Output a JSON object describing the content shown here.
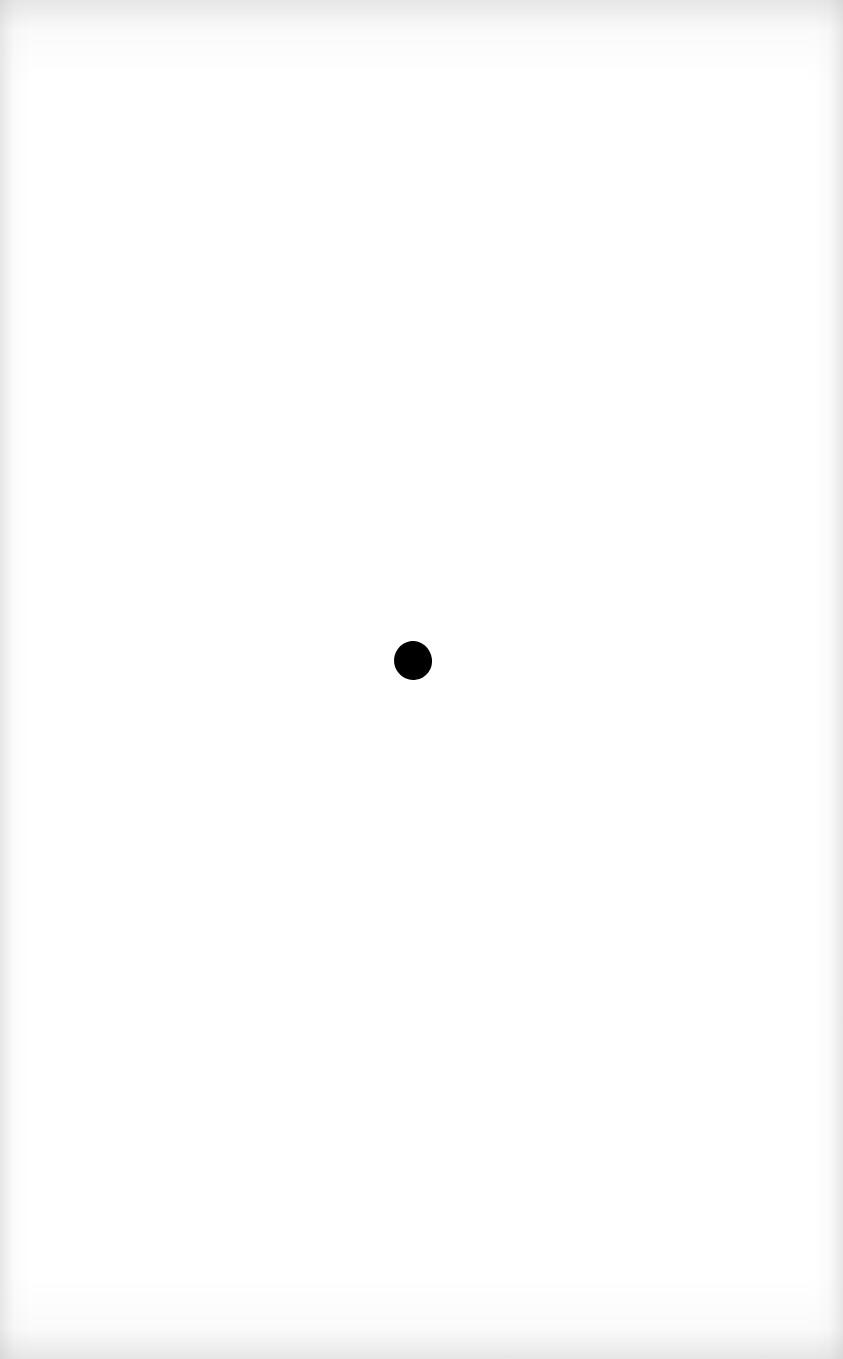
{
  "page": {
    "type": "scanned-blank-page",
    "background_color": "#ffffff",
    "edge_shade_color": "#cdcdcd"
  },
  "marks": [
    {
      "shape": "filled-dot",
      "color": "#000000",
      "x": 394,
      "y": 641,
      "width": 38,
      "height": 39
    }
  ]
}
